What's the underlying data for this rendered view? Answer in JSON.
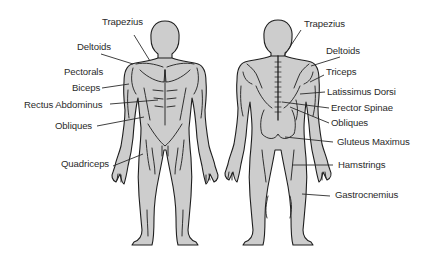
{
  "diagram": {
    "colors": {
      "body_fill": "#cdcdcd",
      "outline": "#1e1e1e",
      "leader_line": "#2a2a2a",
      "label_text": "#2b2b2b",
      "background": "#ffffff"
    },
    "front_view": {
      "labels": [
        {
          "id": "trapezius",
          "text": "Trapezius"
        },
        {
          "id": "deltoids",
          "text": "Deltoids"
        },
        {
          "id": "pectorals",
          "text": "Pectorals"
        },
        {
          "id": "biceps",
          "text": "Biceps"
        },
        {
          "id": "rectus-abdominus",
          "text": "Rectus Abdominus"
        },
        {
          "id": "obliques",
          "text": "Obliques"
        },
        {
          "id": "quadriceps",
          "text": "Quadriceps"
        }
      ]
    },
    "back_view": {
      "labels": [
        {
          "id": "trapezius",
          "text": "Trapezius"
        },
        {
          "id": "deltoids",
          "text": "Deltoids"
        },
        {
          "id": "triceps",
          "text": "Triceps"
        },
        {
          "id": "latissimus-dorsi",
          "text": "Latissimus Dorsi"
        },
        {
          "id": "erector-spinae",
          "text": "Erector Spinae"
        },
        {
          "id": "obliques",
          "text": "Obliques"
        },
        {
          "id": "gluteus-maximus",
          "text": "Gluteus Maximus"
        },
        {
          "id": "hamstrings",
          "text": "Hamstrings"
        },
        {
          "id": "gastrocnemius",
          "text": "Gastrocnemius"
        }
      ]
    }
  }
}
